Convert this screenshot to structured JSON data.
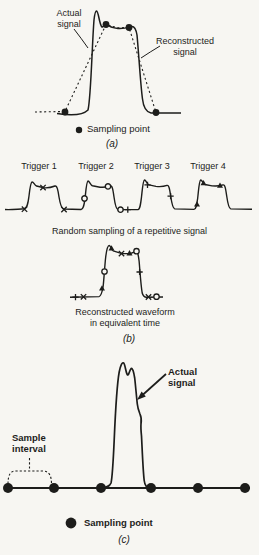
{
  "figure": {
    "colors": {
      "ink": "#1d1d1b",
      "background": "#f7f6f2"
    },
    "panel_a": {
      "label": "(a)",
      "actual_signal": {
        "line1": "Actual",
        "line2": "signal"
      },
      "reconstructed_signal": {
        "line1": "Reconstructed",
        "line2": "signal"
      },
      "legend_label": "Sampling point",
      "legend_marker": "filled-dot"
    },
    "panel_b": {
      "label": "(b)",
      "triggers": [
        {
          "label": "Trigger 1",
          "marker": "x-cross"
        },
        {
          "label": "Trigger 2",
          "marker": "open-circle"
        },
        {
          "label": "Trigger 3",
          "marker": "plus"
        },
        {
          "label": "Trigger 4",
          "marker": "filled-triangle"
        }
      ],
      "caption_top": "Random sampling of a repetitive signal",
      "caption_bottom": {
        "line1": "Reconstructed waveform",
        "line2": "in equivalent time"
      }
    },
    "panel_c": {
      "label": "(c)",
      "sample_interval": {
        "line1": "Sample",
        "line2": "interval"
      },
      "actual_signal": {
        "line1": "Actual",
        "line2": "signal"
      },
      "legend_label": "Sampling point",
      "legend_marker": "filled-dot"
    }
  }
}
